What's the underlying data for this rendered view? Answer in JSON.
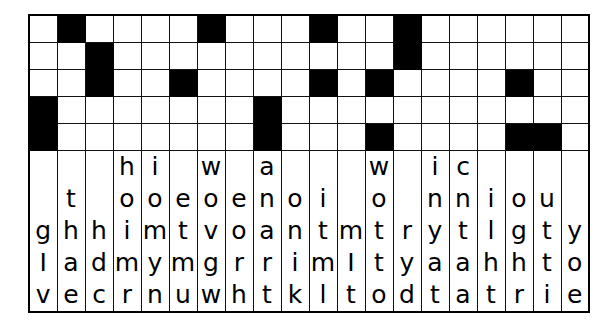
{
  "puzzle": {
    "kind": "fallen-phrase-puzzle",
    "columns": 20,
    "block_rows": 5,
    "letter_rows": 4,
    "colors": {
      "block_fill": "#000000",
      "cell_fill": "#ffffff",
      "grid_line": "#111111",
      "border": "#000000",
      "letter": "#000000"
    },
    "blocks": [
      [
        0,
        1,
        0,
        0,
        0,
        0,
        1,
        0,
        0,
        0,
        1,
        0,
        0,
        1,
        0,
        0,
        0,
        0,
        0,
        0
      ],
      [
        0,
        0,
        1,
        0,
        0,
        0,
        0,
        0,
        0,
        0,
        0,
        0,
        0,
        1,
        0,
        0,
        0,
        0,
        0,
        0
      ],
      [
        0,
        0,
        1,
        0,
        0,
        1,
        0,
        0,
        0,
        0,
        1,
        0,
        1,
        0,
        0,
        0,
        0,
        1,
        0,
        0
      ],
      [
        1,
        0,
        0,
        0,
        0,
        0,
        0,
        0,
        1,
        0,
        0,
        0,
        0,
        0,
        0,
        0,
        0,
        0,
        0,
        0
      ],
      [
        1,
        0,
        0,
        0,
        0,
        0,
        0,
        0,
        1,
        0,
        0,
        0,
        1,
        0,
        0,
        0,
        0,
        1,
        1,
        0
      ]
    ],
    "letters": [
      [
        "",
        "",
        "",
        "h",
        "i",
        "",
        "w",
        "",
        "a",
        "",
        "",
        "",
        "w",
        "",
        "i",
        "c",
        "",
        "",
        "",
        ""
      ],
      [
        "",
        "t",
        "",
        "o",
        "o",
        "e",
        "o",
        "e",
        "n",
        "o",
        "i",
        "",
        "o",
        "",
        "n",
        "n",
        "i",
        "o",
        "u",
        ""
      ],
      [
        "g",
        "h",
        "h",
        "i",
        "m",
        "t",
        "v",
        "o",
        "a",
        "n",
        "t",
        "m",
        "t",
        "r",
        "y",
        "t",
        "l",
        "g",
        "t",
        "y"
      ],
      [
        "I",
        "a",
        "d",
        "m",
        "y",
        "m",
        "g",
        "r",
        "r",
        "i",
        "m",
        "I",
        "t",
        "y",
        "a",
        "a",
        "h",
        "h",
        "t",
        "o"
      ],
      [
        "v",
        "e",
        "c",
        "r",
        "n",
        "u",
        "w",
        "h",
        "t",
        "k",
        "l",
        "t",
        "o",
        "d",
        "t",
        "a",
        "t",
        "r",
        "i",
        "e"
      ]
    ]
  }
}
